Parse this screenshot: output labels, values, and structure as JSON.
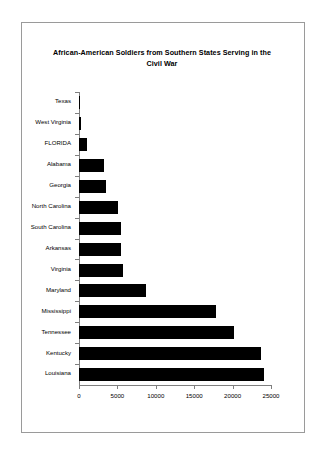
{
  "chart_data": {
    "type": "bar",
    "orientation": "horizontal",
    "title": "African-American Soldiers from Southern States Serving in the Civil War",
    "xlabel": "",
    "ylabel": "",
    "xlim": [
      0,
      25000
    ],
    "xticks": [
      "0",
      "5000",
      "10000",
      "15000",
      "20000",
      "25000"
    ],
    "xtick_values": [
      0,
      5000,
      10000,
      15000,
      20000,
      25000
    ],
    "grid": false,
    "legend": false,
    "bar_color": "#000000",
    "axis_color": "#7f7f7f",
    "categories": [
      "Texas",
      "West Virginia",
      "FLORIDA",
      "Alabama",
      "Georgia",
      "North Carolina",
      "South Carolina",
      "Arkansas",
      "Virginia",
      "Maryland",
      "Mississippi",
      "Tennessee",
      "Kentucky",
      "Louisiana"
    ],
    "values": [
      47,
      196,
      1044,
      3269,
      3486,
      5035,
      5462,
      5526,
      5723,
      8718,
      17869,
      20133,
      23703,
      24052
    ]
  },
  "frame": {
    "border_color": "#9a9a9a"
  }
}
